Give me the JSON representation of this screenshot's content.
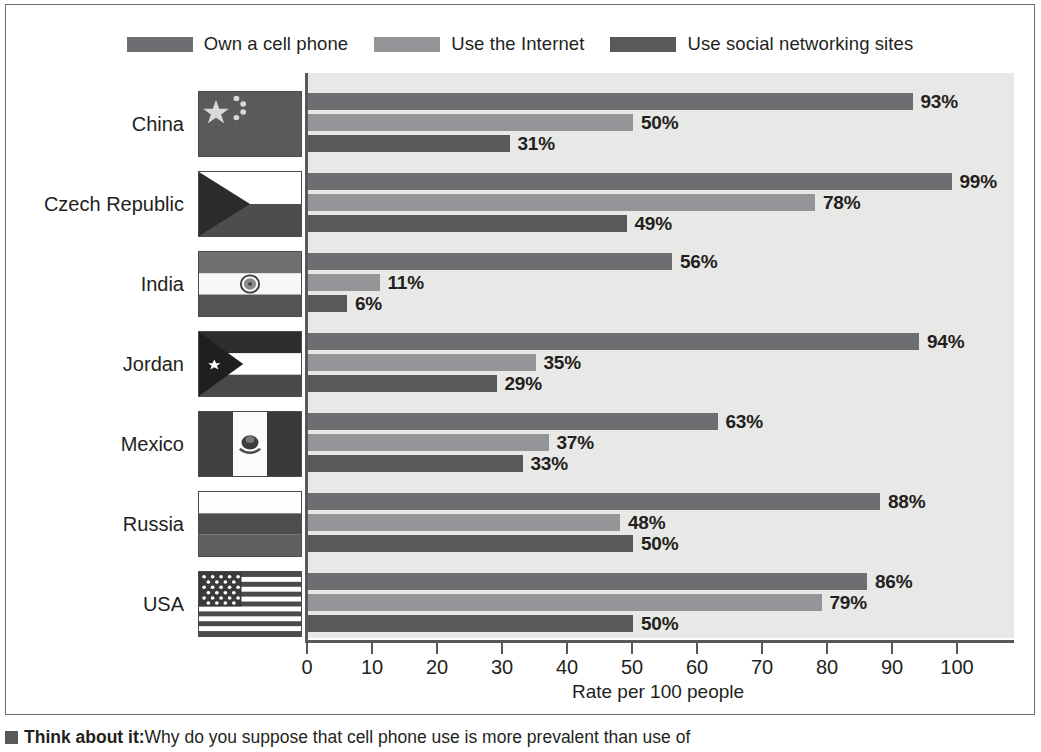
{
  "chart_data": {
    "type": "bar",
    "orientation": "horizontal",
    "title": "",
    "xlabel": "Rate per 100 people",
    "ylabel": "",
    "xlim": [
      0,
      100
    ],
    "xticks": [
      0,
      10,
      20,
      30,
      40,
      50,
      60,
      70,
      80,
      90,
      100
    ],
    "grid": false,
    "legend_position": "top-center",
    "categories": [
      "China",
      "Czech Republic",
      "India",
      "Jordan",
      "Mexico",
      "Russia",
      "USA"
    ],
    "series": [
      {
        "name": "Own a cell phone",
        "color": "#6d6e71",
        "values": [
          93,
          99,
          56,
          94,
          63,
          88,
          86
        ],
        "labels": [
          "93%",
          "99%",
          "56%",
          "94%",
          "63%",
          "88%",
          "86%"
        ]
      },
      {
        "name": "Use the Internet",
        "color": "#939598",
        "values": [
          50,
          78,
          11,
          35,
          37,
          48,
          79
        ],
        "labels": [
          "50%",
          "78%",
          "11%",
          "35%",
          "37%",
          "48%",
          "79%"
        ]
      },
      {
        "name": "Use social networking sites",
        "color": "#58595b",
        "values": [
          31,
          49,
          6,
          29,
          33,
          50,
          50
        ],
        "labels": [
          "31%",
          "49%",
          "6%",
          "29%",
          "33%",
          "50%",
          "50%"
        ]
      }
    ]
  },
  "legend": {
    "items": [
      {
        "label": "Own a cell phone",
        "color": "#6d6e71",
        "icon": "legend-swatch-icon"
      },
      {
        "label": "Use the Internet",
        "color": "#939598",
        "icon": "legend-swatch-icon"
      },
      {
        "label": "Use social networking sites",
        "color": "#58595b",
        "icon": "legend-swatch-icon"
      }
    ]
  },
  "axis": {
    "x_title": "Rate per 100 people",
    "tick_labels": [
      "0",
      "10",
      "20",
      "30",
      "40",
      "50",
      "60",
      "70",
      "80",
      "90",
      "100"
    ]
  },
  "countries": [
    {
      "label": "China",
      "flag_icon": "flag-china-icon"
    },
    {
      "label": "Czech Republic",
      "flag_icon": "flag-czech-republic-icon"
    },
    {
      "label": "India",
      "flag_icon": "flag-india-icon"
    },
    {
      "label": "Jordan",
      "flag_icon": "flag-jordan-icon"
    },
    {
      "label": "Mexico",
      "flag_icon": "flag-mexico-icon"
    },
    {
      "label": "Russia",
      "flag_icon": "flag-russia-icon"
    },
    {
      "label": "USA",
      "flag_icon": "flag-usa-icon"
    }
  ],
  "caption": {
    "lead": "Think about it:",
    "rest": "Why do you suppose that cell phone use is more prevalent than use of"
  },
  "colors": {
    "plot_background": "#e8e8e6",
    "page_background": "#ffffff",
    "axis": "#58595b",
    "text": "#231f20",
    "frame": "#6d6e71"
  }
}
